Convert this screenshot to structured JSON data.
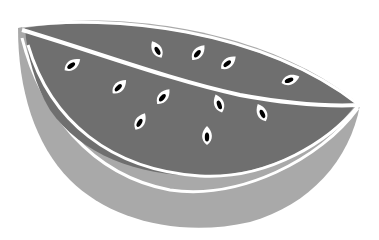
{
  "image": {
    "subject": "watermelon slice illustration",
    "style": "grayscale flat vector",
    "width": 379,
    "height": 240
  },
  "colors": {
    "background": "#ffffff",
    "rind": "#a9a9a9",
    "flesh": "#6f6f6f",
    "divider": "#ffffff",
    "seed_outline": "#ffffff",
    "seed_core": "#000000"
  },
  "seeds": [
    {
      "cx": 157,
      "cy": 50,
      "rot": -30
    },
    {
      "cx": 198,
      "cy": 53,
      "rot": 40
    },
    {
      "cx": 228,
      "cy": 63,
      "rot": 50
    },
    {
      "cx": 72,
      "cy": 65,
      "rot": 55
    },
    {
      "cx": 290,
      "cy": 80,
      "rot": 70
    },
    {
      "cx": 119,
      "cy": 87,
      "rot": 45
    },
    {
      "cx": 163,
      "cy": 97,
      "rot": 40
    },
    {
      "cx": 219,
      "cy": 104,
      "rot": -20
    },
    {
      "cx": 262,
      "cy": 113,
      "rot": -25
    },
    {
      "cx": 140,
      "cy": 122,
      "rot": 30
    },
    {
      "cx": 207,
      "cy": 136,
      "rot": 0
    }
  ]
}
